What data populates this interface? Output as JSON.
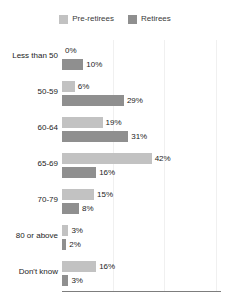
{
  "chart_data": {
    "type": "bar",
    "orientation": "horizontal",
    "title": "",
    "subtitle": "",
    "xlabel": "",
    "ylabel": "",
    "xlim": [
      0,
      74
    ],
    "grid": true,
    "gridlines_percent": [
      24,
      48,
      72
    ],
    "legend_position": "top-center",
    "categories": [
      "Less than 50",
      "50-59",
      "60-64",
      "65-69",
      "70-79",
      "80 or above",
      "Don't know"
    ],
    "series": [
      {
        "name": "Pre-retirees",
        "color": "#c2c2c2",
        "values": [
          0,
          6,
          19,
          42,
          15,
          3,
          16
        ],
        "labels": [
          "0%",
          "6%",
          "19%",
          "42%",
          "15%",
          "3%",
          "16%"
        ]
      },
      {
        "name": "Retirees",
        "color": "#8f8f8f",
        "values": [
          10,
          29,
          31,
          16,
          8,
          2,
          3
        ],
        "labels": [
          "10%",
          "29%",
          "31%",
          "16%",
          "8%",
          "2%",
          "3%"
        ]
      }
    ]
  },
  "legend": {
    "items": [
      {
        "label": "Pre-retirees",
        "color": "#c2c2c2"
      },
      {
        "label": "Retirees",
        "color": "#8f8f8f"
      }
    ]
  },
  "axis": {
    "line_color": "#7d7d7d",
    "grid_color": "#f0f0f0"
  }
}
